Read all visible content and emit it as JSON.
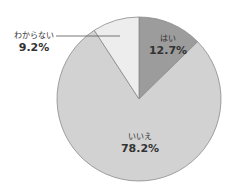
{
  "chart_data": {
    "type": "pie",
    "title": "",
    "slices": [
      {
        "label": "はい",
        "value": 12.7,
        "display": "12.7%",
        "color": "#9c9c9c"
      },
      {
        "label": "いいえ",
        "value": 78.2,
        "display": "78.2%",
        "color": "#d2d2d2"
      },
      {
        "label": "わからない",
        "value": 9.2,
        "display": "9.2%",
        "color": "#ededed"
      }
    ],
    "start_angle": "12 o'clock, clockwise",
    "legend": "none (inline labels)"
  }
}
